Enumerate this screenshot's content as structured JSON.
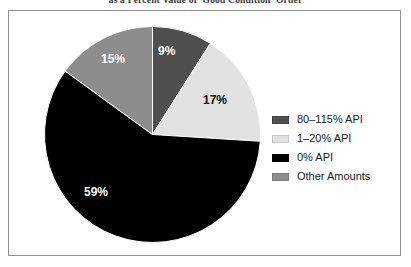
{
  "chart_data": {
    "type": "pie",
    "title": "as a Percent Value of 'Good Condition' Order",
    "xlabel": "",
    "ylabel": "",
    "grid": false,
    "legend_position": "right",
    "categories": [
      "80–115% API",
      "1–20% API",
      "0% API",
      "Other Amounts"
    ],
    "values": [
      9,
      17,
      59,
      15
    ],
    "value_labels": [
      "9%",
      "17%",
      "59%",
      "15%"
    ],
    "colors": [
      "#4f4f4f",
      "#e2e2e2",
      "#000000",
      "#8d8d8d"
    ],
    "start_angle_deg": 0,
    "direction": "clockwise",
    "units": "percent"
  },
  "legend": {
    "items": [
      {
        "label": "80–115% API",
        "color": "#4f4f4f"
      },
      {
        "label": "1–20% API",
        "color": "#e2e2e2"
      },
      {
        "label": "0% API",
        "color": "#000000"
      },
      {
        "label": "Other Amounts",
        "color": "#8d8d8d"
      }
    ]
  },
  "frame": {
    "border_color": "#8f9396"
  }
}
